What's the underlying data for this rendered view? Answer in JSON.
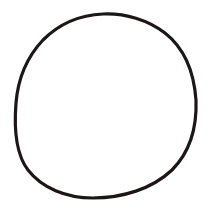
{
  "image": {
    "description": "Hand-drawn circle outline on white background",
    "background_color": "#ffffff",
    "stroke_color": "#1c1616",
    "stroke_width": 3.2,
    "shape": {
      "type": "freehand-circle",
      "path": "M103,14 C125,13 148,20 165,33 C184,48 194,72 196,100 C197,128 190,152 172,170 C152,189 122,198 93,198 C66,198 42,188 28,170 C15,153 14,128 16,103 C18,78 27,57 43,40 C60,23 80,15 103,14 Z"
    }
  }
}
